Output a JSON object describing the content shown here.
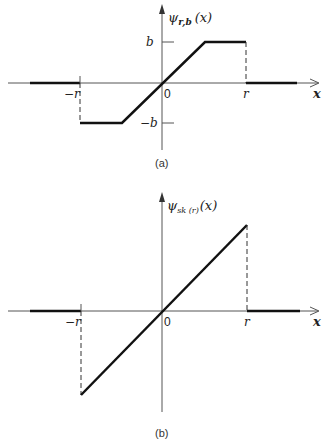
{
  "figure_a": {
    "ylabel": "ψ",
    "ylabel_sub": "r,b",
    "ylabel_arg": "(x)",
    "xlabel": "x",
    "origin": "0",
    "tick_b": "b",
    "tick_neg_b": "−b",
    "tick_neg_r": "−r",
    "tick_r": "r",
    "caption": "(a)"
  },
  "figure_b": {
    "ylabel": "ψ",
    "ylabel_sub": "sk (r)",
    "ylabel_arg": "(x)",
    "xlabel": "x",
    "origin": "0",
    "tick_neg_r": "−r",
    "tick_r": "r",
    "caption": "(b)"
  },
  "colors": {
    "line": "#111111",
    "axis": "#444444"
  }
}
